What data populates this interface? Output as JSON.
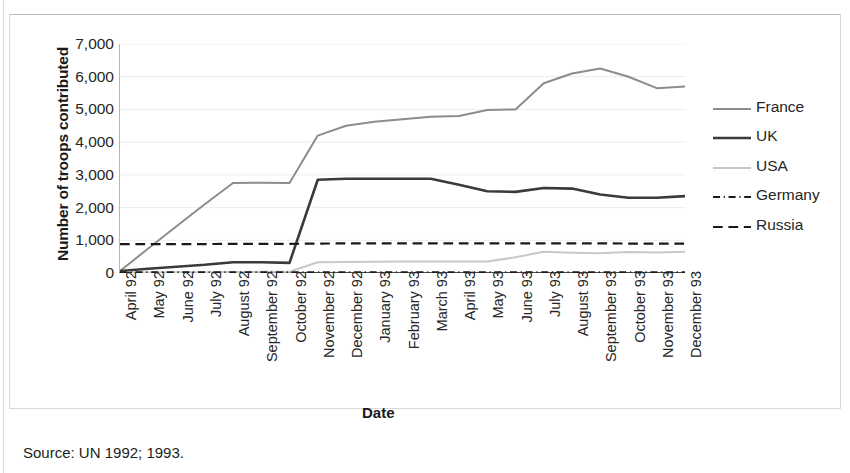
{
  "figure": {
    "source_note": "Source: UN 1992; 1993.",
    "frame_visible": true
  },
  "chart_data": {
    "type": "line",
    "title": "",
    "xlabel": "Date",
    "ylabel": "Number of troops contributed",
    "ylim": [
      0,
      7000
    ],
    "ytick_labels": [
      "7,000",
      "6,000",
      "5,000",
      "4,000",
      "3,000",
      "2,000",
      "1,000",
      "0"
    ],
    "ytick_values": [
      7000,
      6000,
      5000,
      4000,
      3000,
      2000,
      1000,
      0
    ],
    "grid": "horizontal",
    "legend_position": "right",
    "categories": [
      "April 92",
      "May 92",
      "June 92",
      "July 92",
      "August 92",
      "September 92",
      "October 92",
      "November 92",
      "December 92",
      "January 93",
      "February 93",
      "March 93",
      "April 93",
      "May 93",
      "June 93",
      "July 93",
      "August 93",
      "September 93",
      "October 93",
      "November 93",
      "December 93"
    ],
    "series": [
      {
        "name": "France",
        "color": "#8c8c8c",
        "style": "solid",
        "width": 2.0,
        "values": [
          60,
          750,
          1430,
          2100,
          2750,
          2760,
          2750,
          4200,
          4500,
          4620,
          4700,
          4780,
          4800,
          4980,
          5000,
          5800,
          6100,
          6250,
          6000,
          5650,
          5700
        ]
      },
      {
        "name": "UK",
        "color": "#3a3a3a",
        "style": "solid",
        "width": 2.6,
        "values": [
          60,
          130,
          190,
          250,
          330,
          330,
          310,
          2850,
          2880,
          2880,
          2880,
          2880,
          2700,
          2500,
          2480,
          2600,
          2580,
          2400,
          2300,
          2300,
          2350
        ]
      },
      {
        "name": "USA",
        "color": "#c8c8c8",
        "style": "solid",
        "width": 2.0,
        "values": [
          10,
          15,
          20,
          25,
          30,
          35,
          40,
          330,
          340,
          345,
          350,
          350,
          350,
          350,
          480,
          650,
          620,
          600,
          640,
          630,
          650
        ]
      },
      {
        "name": "Germany",
        "color": "#1a1a1a",
        "style": "dashdot",
        "width": 2.2,
        "values": [
          20,
          20,
          20,
          20,
          20,
          20,
          20,
          20,
          20,
          20,
          20,
          20,
          20,
          20,
          20,
          20,
          20,
          20,
          20,
          20,
          20
        ]
      },
      {
        "name": "Russia",
        "color": "#1a1a1a",
        "style": "dashed",
        "width": 2.2,
        "values": [
          880,
          880,
          885,
          885,
          890,
          890,
          890,
          900,
          905,
          905,
          905,
          905,
          905,
          905,
          905,
          905,
          905,
          905,
          900,
          900,
          900
        ]
      }
    ]
  }
}
